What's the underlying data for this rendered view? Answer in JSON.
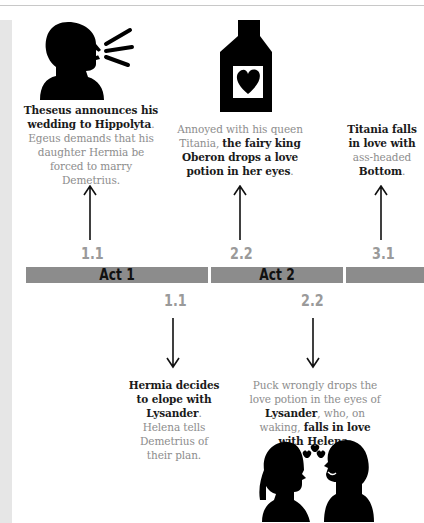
{
  "timeline": {
    "acts": [
      {
        "label": "Act 1"
      },
      {
        "label": "Act 2"
      },
      {
        "label": ""
      }
    ],
    "upper_events": [
      {
        "scene": "1.1",
        "icon": "speaking-person-icon",
        "parts": [
          {
            "text": "Theseus announces his wedding to Hippolyta",
            "bold": true
          },
          {
            "text": ". Egeus demands that his daughter Hermia be forced to marry Demetrius.",
            "bold": false
          }
        ]
      },
      {
        "scene": "2.2",
        "icon": "love-potion-bottle-icon",
        "parts": [
          {
            "text": "Annoyed with his queen Titania, ",
            "bold": false
          },
          {
            "text": "the fairy king Oberon drops a love potion in her eyes",
            "bold": true
          },
          {
            "text": ".",
            "bold": false
          }
        ]
      },
      {
        "scene": "3.1",
        "icon": "",
        "parts": [
          {
            "text": "Titania falls in love with",
            "bold": true
          },
          {
            "text": " ass-headed ",
            "bold": false
          },
          {
            "text": "Bottom",
            "bold": true
          },
          {
            "text": ".",
            "bold": false
          }
        ]
      }
    ],
    "lower_events": [
      {
        "scene": "1.1",
        "icon": "",
        "parts": [
          {
            "text": "Hermia decides to elope with Lysander",
            "bold": true
          },
          {
            "text": ". Helena tells Demetrius of their plan.",
            "bold": false
          }
        ]
      },
      {
        "scene": "2.2",
        "icon": "couple-in-love-icon",
        "parts": [
          {
            "text": "Puck wrongly drops the love potion in the eyes of ",
            "bold": false
          },
          {
            "text": "Lysander",
            "bold": true
          },
          {
            "text": ", who, on waking, ",
            "bold": false
          },
          {
            "text": "falls in love with Helena",
            "bold": true
          },
          {
            "text": ".",
            "bold": false
          }
        ]
      }
    ]
  },
  "colors": {
    "bar": "#8c8c8c",
    "scene_number": "#9a9a9a",
    "body_text": "#8d8d8d",
    "bold_text": "#1a1a1a"
  }
}
